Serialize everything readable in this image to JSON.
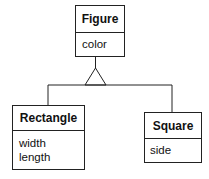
{
  "diagram": {
    "type": "uml-class-inheritance",
    "classes": [
      {
        "id": "figure",
        "name": "Figure",
        "attributes": [
          "color"
        ]
      },
      {
        "id": "rectangle",
        "name": "Rectangle",
        "attributes": [
          "width",
          "length"
        ]
      },
      {
        "id": "square",
        "name": "Square",
        "attributes": [
          "side"
        ]
      }
    ],
    "relationships": [
      {
        "type": "generalization",
        "parent": "Figure",
        "children": [
          "Rectangle",
          "Square"
        ]
      }
    ],
    "colors": {
      "line": "#222222",
      "background": "#ffffff",
      "text": "#111111"
    }
  }
}
